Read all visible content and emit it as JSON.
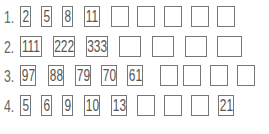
{
  "worksheet": {
    "rows": [
      {
        "label": "1.",
        "cells": [
          "2",
          "5",
          "8",
          "11",
          "",
          "",
          "",
          "",
          ""
        ]
      },
      {
        "label": "2.",
        "cells": [
          "111",
          "222",
          "333",
          "",
          "",
          "",
          ""
        ]
      },
      {
        "label": "3.",
        "cells": [
          "97",
          "88",
          "79",
          "70",
          "61",
          "",
          "",
          "",
          ""
        ]
      },
      {
        "label": "4.",
        "cells": [
          "5",
          "6",
          "9",
          "10",
          "13",
          "",
          "",
          "",
          "21"
        ]
      }
    ]
  }
}
